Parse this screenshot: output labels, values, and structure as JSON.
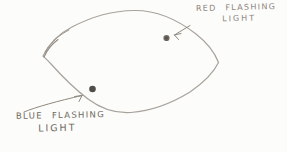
{
  "sketch": {
    "description_of_lines": "hand-drawn pencil lens/oval outline with two marked dots",
    "labels": {
      "red_light": {
        "line1": "RED FLASHING",
        "line2": "LIGHT"
      },
      "blue_light": {
        "line1": "BLUE FLASHING",
        "line2": "LIGHT"
      }
    },
    "colors": {
      "paper": "#fcfcfa",
      "pencil_line": "#a8a29b",
      "arrow_line": "#8f897f",
      "red_dot_fill": "#6f6a62",
      "red_dot_core": "#58544d",
      "blue_dot_fill": "#504e49",
      "red_label_text": "#8c867e",
      "blue_label_text": "#6e6961"
    }
  }
}
